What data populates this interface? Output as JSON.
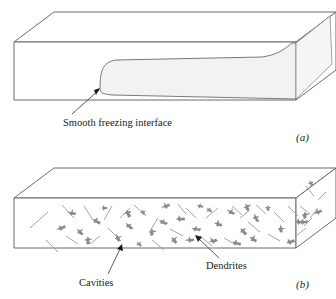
{
  "figure": {
    "type": "two-panel line diagram of a freezing slab",
    "background_color": "#ffffff",
    "line_color": "#6b6b6b",
    "dark_line_color": "#3a3a3a",
    "frozen_fill_color": "#f2f2f2",
    "dendrite_color": "#8a8a8a",
    "cavity_color": "#9a9a9a"
  },
  "panel_a": {
    "label": "(a)",
    "callout": "Smooth freezing interface",
    "description": "rectangular slab with smooth tongue-shaped frozen region"
  },
  "panel_b": {
    "label": "(b)",
    "callout_left": "Cavities",
    "callout_right": "Dendrites",
    "description": "rectangular slab filled with dendrites and cavities"
  },
  "geometry": {
    "box_a": {
      "front_left_x": 14,
      "front_top_y": 42,
      "front_bottom_y": 100,
      "front_right_x": 296,
      "depth_dx": 40,
      "depth_dy": 30
    },
    "box_b": {
      "front_left_x": 14,
      "front_top_y": 198,
      "front_bottom_y": 248,
      "front_right_x": 296,
      "depth_dx": 40,
      "depth_dy": 30
    }
  },
  "dendrites": [
    [
      72,
      213
    ],
    [
      96,
      221
    ],
    [
      129,
      226
    ],
    [
      143,
      212
    ],
    [
      152,
      232
    ],
    [
      166,
      206
    ],
    [
      180,
      219
    ],
    [
      196,
      229
    ],
    [
      209,
      210
    ],
    [
      174,
      240
    ],
    [
      118,
      238
    ],
    [
      88,
      240
    ],
    [
      61,
      228
    ],
    [
      104,
      208
    ],
    [
      218,
      224
    ],
    [
      231,
      212
    ],
    [
      243,
      231
    ],
    [
      256,
      218
    ],
    [
      268,
      208
    ],
    [
      213,
      241
    ],
    [
      190,
      240
    ],
    [
      236,
      243
    ],
    [
      163,
      222
    ],
    [
      139,
      244
    ],
    [
      247,
      207
    ],
    [
      281,
      229
    ],
    [
      290,
      242
    ],
    [
      303,
      222
    ],
    [
      200,
      206
    ],
    [
      253,
      239
    ],
    [
      80,
      232
    ],
    [
      128,
      213
    ]
  ],
  "cavities": [
    [
      30,
      228,
      48,
      212
    ],
    [
      46,
      240,
      58,
      252
    ],
    [
      62,
      205,
      74,
      218
    ],
    [
      84,
      206,
      93,
      220
    ],
    [
      108,
      228,
      121,
      241
    ],
    [
      112,
      206,
      104,
      220
    ],
    [
      134,
      205,
      146,
      216
    ],
    [
      152,
      240,
      164,
      250
    ],
    [
      158,
      218,
      150,
      231
    ],
    [
      170,
      229,
      183,
      236
    ],
    [
      186,
      208,
      196,
      218
    ],
    [
      200,
      236,
      212,
      246
    ],
    [
      206,
      218,
      218,
      208
    ],
    [
      224,
      238,
      236,
      245
    ],
    [
      232,
      206,
      242,
      215
    ],
    [
      248,
      222,
      260,
      232
    ],
    [
      256,
      205,
      266,
      214
    ],
    [
      268,
      234,
      280,
      241
    ],
    [
      274,
      212,
      284,
      222
    ],
    [
      90,
      244,
      100,
      236
    ],
    [
      120,
      218,
      130,
      208
    ],
    [
      178,
      204,
      186,
      214
    ],
    [
      66,
      236,
      78,
      244
    ],
    [
      240,
      218,
      250,
      210
    ],
    [
      288,
      206,
      298,
      216
    ],
    [
      296,
      236,
      306,
      228
    ],
    [
      310,
      218,
      318,
      208
    ]
  ]
}
